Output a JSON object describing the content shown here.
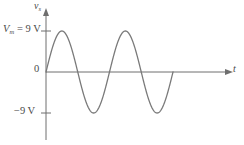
{
  "figure": {
    "background_color": "#ffffff",
    "line_color": "#7a7a7a",
    "axis_color": "#6e6e6e",
    "text_color": "#4a4a4a"
  },
  "labels": {
    "peak_symbol": "V",
    "peak_subscript": "m",
    "peak_equals": " = 9 V",
    "negative_peak": "−9 V",
    "origin": "0",
    "y_axis_symbol": "v",
    "y_axis_subscript": "s",
    "x_axis_symbol": "t"
  },
  "chart_data": {
    "type": "line",
    "title": "",
    "xlabel": "t",
    "ylabel": "v_s",
    "grid": false,
    "legend": null,
    "ylim": [
      -12,
      12
    ],
    "xlim": [
      0,
      2
    ],
    "y_ticks": [
      9,
      0,
      -9
    ],
    "y_tick_labels": [
      "V_m = 9 V",
      "0",
      "−9 V"
    ],
    "x_ticks": [],
    "x_tick_labels": [],
    "annotations": [
      {
        "text": "V_m = 9 V",
        "value": 9,
        "kind": "y-level"
      },
      {
        "text": "−9 V",
        "value": -9,
        "kind": "y-level"
      },
      {
        "text": "0",
        "value": 0,
        "kind": "origin"
      }
    ],
    "series": [
      {
        "name": "source voltage",
        "waveform": "sine",
        "amplitude": 9,
        "cycles": 2,
        "phase": 0,
        "x": [
          0,
          0.125,
          0.25,
          0.375,
          0.5,
          0.625,
          0.75,
          0.875,
          1.0,
          1.125,
          1.25,
          1.375,
          1.5,
          1.625,
          1.75,
          1.875,
          2.0
        ],
        "values": [
          0,
          6.36,
          9,
          6.36,
          0,
          -6.36,
          -9,
          -6.36,
          0,
          6.36,
          9,
          6.36,
          0,
          -6.36,
          -9,
          -6.36,
          0
        ]
      }
    ]
  }
}
